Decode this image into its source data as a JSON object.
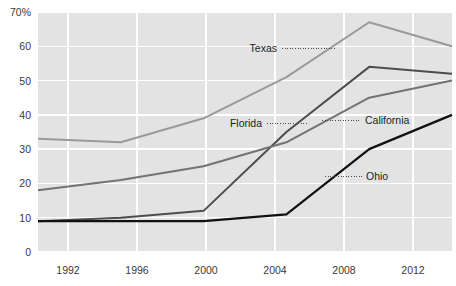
{
  "chart_data": {
    "type": "line",
    "title": "",
    "subtitle": "",
    "xlabel": "",
    "ylabel": "",
    "x": [
      1992,
      1996,
      2000,
      2004,
      2008,
      2012
    ],
    "categories": [
      "1992",
      "1996",
      "2000",
      "2004",
      "2008",
      "2012"
    ],
    "xlim": [
      1992,
      2012
    ],
    "ylim": [
      0,
      70
    ],
    "yticks": [
      0,
      10,
      20,
      30,
      40,
      50,
      60,
      70
    ],
    "ytick_labels": [
      "0",
      "10",
      "20",
      "30",
      "40",
      "50",
      "60",
      "70%"
    ],
    "xtick_labels": [
      "1992",
      "1996",
      "2000",
      "2004",
      "2008",
      "2012"
    ],
    "grid": true,
    "grid_color": "#ffffff",
    "plot_background": "#e3e3e3",
    "legend_position": "inline-annotations",
    "series": [
      {
        "name": "Texas",
        "color": "#9a9a9a",
        "width": 2.0,
        "values": [
          33,
          32,
          39,
          51,
          67,
          60
        ]
      },
      {
        "name": "Florida",
        "color": "#4d4d4d",
        "width": 2.0,
        "values": [
          9,
          10,
          12,
          35,
          54,
          52
        ]
      },
      {
        "name": "California",
        "color": "#737373",
        "width": 2.0,
        "values": [
          18,
          21,
          25,
          32,
          45,
          50
        ]
      },
      {
        "name": "Ohio",
        "color": "#111111",
        "width": 2.2,
        "values": [
          9,
          9,
          9,
          11,
          30,
          40
        ]
      }
    ],
    "annotations": [
      {
        "label": "Texas",
        "text_x": 277,
        "text_y": 52,
        "align": "end",
        "leader_from_x": 282,
        "leader_to_x": 336,
        "leader_y": 48.5
      },
      {
        "label": "Florida",
        "text_x": 262,
        "text_y": 127,
        "align": "end",
        "leader_from_x": 267,
        "leader_to_x": 307,
        "leader_y": 123.5
      },
      {
        "label": "California",
        "text_x": 365,
        "text_y": 124,
        "align": "start",
        "leader_from_x": 322,
        "leader_to_x": 361,
        "leader_y": 120.5
      },
      {
        "label": "Ohio",
        "text_x": 366,
        "text_y": 180,
        "align": "start",
        "leader_from_x": 325,
        "leader_to_x": 362,
        "leader_y": 176.5
      }
    ]
  },
  "yticks": {
    "t0": "0",
    "t1": "10",
    "t2": "20",
    "t3": "30",
    "t4": "40",
    "t5": "50",
    "t6": "60",
    "t7": "70%"
  },
  "xticks": {
    "t0": "1992",
    "t1": "1996",
    "t2": "2000",
    "t3": "2004",
    "t4": "2008",
    "t5": "2012"
  },
  "labels": {
    "texas": "Texas",
    "florida": "Florida",
    "california": "California",
    "ohio": "Ohio"
  }
}
